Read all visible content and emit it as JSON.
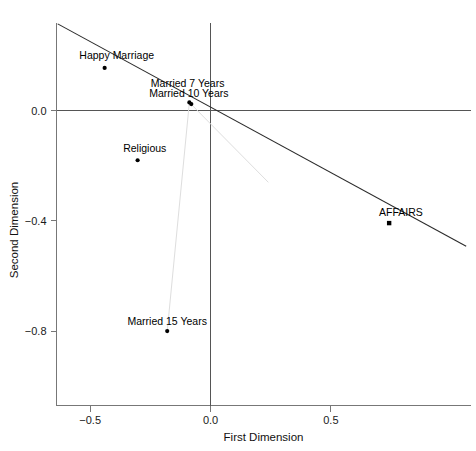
{
  "chart_data": {
    "type": "scatter",
    "title": "",
    "subtitle": "",
    "xlabel": "First Dimension",
    "ylabel": "Second Dimension",
    "xlim": [
      -0.64,
      1.08
    ],
    "ylim": [
      -1.07,
      0.32
    ],
    "xticks": [
      -0.5,
      0.0,
      0.5
    ],
    "xticklabels": [
      "−0.5",
      "0.0",
      "0.5"
    ],
    "yticks": [
      0.0,
      -0.4,
      -0.8
    ],
    "yticklabels": [
      "0.0",
      "−0.4",
      "−0.8"
    ],
    "grid": false,
    "legend": "none",
    "reference_lines": {
      "horizontal_zero": 0.0,
      "vertical_zero": 0.0
    },
    "points": [
      {
        "label": "Happy Marriage",
        "x": -0.44,
        "y": 0.155,
        "marker": "filled-circle",
        "label_dx": -0.105,
        "label_dy": 0.048
      },
      {
        "label": "Married 7 Years",
        "x": -0.088,
        "y": 0.03,
        "marker": "filled-circle",
        "label_dx": -0.16,
        "label_dy": 0.072
      },
      {
        "label": "Married 10 Years",
        "x": -0.08,
        "y": 0.024,
        "marker": "filled-circle",
        "label_dx": -0.175,
        "label_dy": 0.04
      },
      {
        "label": "Religious",
        "x": -0.303,
        "y": -0.18,
        "marker": "filled-circle",
        "label_dx": -0.06,
        "label_dy": 0.046
      },
      {
        "label": "Married 15 Years",
        "x": -0.18,
        "y": -0.8,
        "marker": "filled-circle",
        "label_dx": -0.165,
        "label_dy": 0.038
      },
      {
        "label": "AFFAIRS",
        "x": 0.742,
        "y": -0.408,
        "marker": "filled-square",
        "label_dx": -0.042,
        "label_dy": 0.042
      }
    ],
    "series": [
      {
        "name": "regression-line",
        "type": "line",
        "color": "#2b2b2b",
        "width": 1.1,
        "x": [
          -0.635,
          1.062
        ],
        "y": [
          0.315,
          -0.492
        ]
      },
      {
        "name": "profile-path",
        "type": "line",
        "color": "#dedede",
        "width": 1.0,
        "x": [
          -0.18,
          -0.088,
          0.24
        ],
        "y": [
          -0.8,
          0.03,
          -0.26
        ]
      }
    ],
    "colors": {
      "frame": "#777777",
      "zero_axis": "#555555",
      "point": "#000000",
      "regression": "#2b2b2b",
      "profile": "#dedede",
      "text": "#111111",
      "background": "#ffffff"
    }
  }
}
